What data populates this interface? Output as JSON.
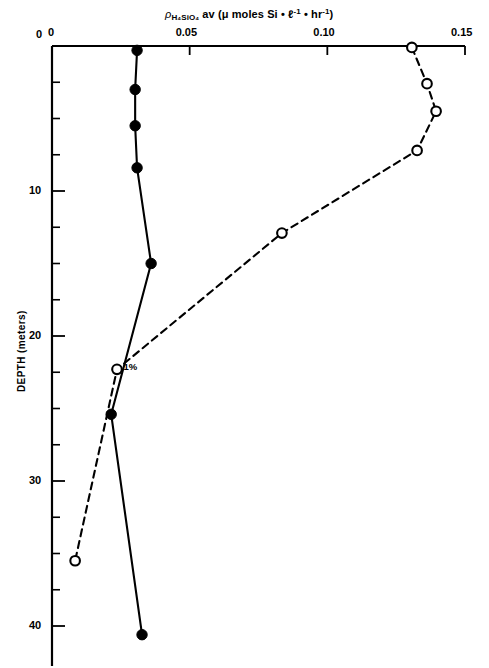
{
  "chart_data": {
    "type": "line",
    "title_parts": {
      "rho": "ρ",
      "subscript": "H₄SiO₄",
      "rest": "av (μ moles   Si • ℓ",
      "sup1": "-1",
      "mid": " • hr",
      "sup2": "-1",
      "close": ")"
    },
    "xlabel": "ρ H4SiO4 av (μ moles Si • ℓ-1 • hr-1)",
    "ylabel": "DEPTH (meters)",
    "xlim": [
      0,
      0.15
    ],
    "ylim": [
      0,
      42
    ],
    "y_inverted": true,
    "x_axis_position": "top",
    "grid": false,
    "legend": false,
    "xticks": [
      0,
      0.05,
      0.1,
      0.15
    ],
    "xticklabels": [
      "0",
      "0.05",
      "0.10",
      "0.15"
    ],
    "yticks": [
      0,
      10,
      20,
      30,
      40
    ],
    "yticklabels": [
      "0",
      "10",
      "20",
      "30",
      "40"
    ],
    "y_minor_ticks": [
      2.5,
      5,
      7.5,
      12.5,
      15,
      17.5,
      22.5,
      25,
      27.5,
      32.5,
      35,
      37.5
    ],
    "annotations": [
      {
        "text": "1%",
        "x": 0.0245,
        "y": 22.3
      }
    ],
    "series": [
      {
        "name": "solid-filled",
        "marker": "filled-circle",
        "linestyle": "solid",
        "color": "#000000",
        "points": [
          {
            "x": 0.0309,
            "y": 0.3
          },
          {
            "x": 0.0302,
            "y": 3.0
          },
          {
            "x": 0.0302,
            "y": 5.5
          },
          {
            "x": 0.0309,
            "y": 8.4
          },
          {
            "x": 0.036,
            "y": 15.0
          },
          {
            "x": 0.0215,
            "y": 25.4
          },
          {
            "x": 0.0327,
            "y": 40.6
          }
        ]
      },
      {
        "name": "dashed-open",
        "marker": "open-circle",
        "linestyle": "dashed",
        "color": "#000000",
        "points": [
          {
            "x": 0.1307,
            "y": 0.1
          },
          {
            "x": 0.1362,
            "y": 2.6
          },
          {
            "x": 0.1395,
            "y": 4.5
          },
          {
            "x": 0.1326,
            "y": 7.2
          },
          {
            "x": 0.0835,
            "y": 12.9
          },
          {
            "x": 0.0236,
            "y": 22.3
          },
          {
            "x": 0.0084,
            "y": 35.5
          }
        ]
      }
    ]
  }
}
